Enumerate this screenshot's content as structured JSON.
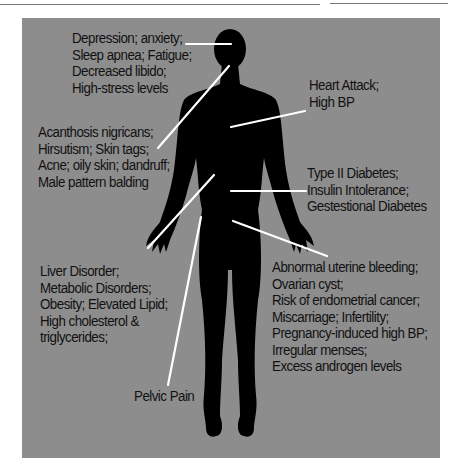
{
  "diagram": {
    "title": "",
    "background_color": "#8d8d8d",
    "silhouette_color": "#000000",
    "leader_line_color": "#ffffff",
    "labels": [
      {
        "id": "brain",
        "lines": [
          "Depression; anxiety;",
          "Sleep apnea; Fatigue;",
          "Decreased libido;",
          "High-stress levels"
        ]
      },
      {
        "id": "heart",
        "lines": [
          "Heart Attack;",
          "High BP"
        ]
      },
      {
        "id": "skin",
        "lines": [
          "Acanthosis nigricans;",
          "Hirsutism; Skin tags;",
          "Acne; oily skin; dandruff;",
          "Male pattern balding"
        ]
      },
      {
        "id": "pancreas",
        "lines": [
          "Type II Diabetes;",
          "Insulin Intolerance;",
          "Gestestional Diabetes"
        ]
      },
      {
        "id": "liver",
        "lines": [
          "Liver Disorder;",
          "Metabolic Disorders;",
          "Obesity; Elevated Lipid;",
          "High cholesterol &",
          "triglycerides;"
        ]
      },
      {
        "id": "reproductive",
        "lines": [
          "Abnormal uterine bleeding;",
          "Ovarian cyst;",
          "Risk of endometrial cancer;",
          "Miscarriage; Infertility;",
          "Pregnancy-induced high BP;",
          "Irregular menses;",
          "Excess androgen levels"
        ]
      },
      {
        "id": "pelvis",
        "lines": [
          "Pelvic Pain"
        ]
      }
    ]
  }
}
